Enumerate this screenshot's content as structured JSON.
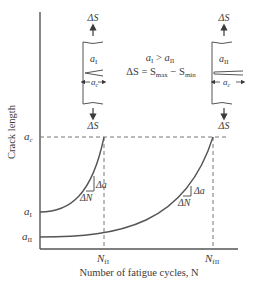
{
  "diagram": {
    "type": "fatigue crack growth curves",
    "y_axis_label": "Crack length",
    "x_axis_label": "Number of fatigue cycles, N",
    "y_ticks": {
      "critical": {
        "base": "a",
        "sub": "c"
      },
      "initial_I": {
        "base": "a",
        "sub": "I"
      },
      "initial_II": {
        "base": "a",
        "sub": "II"
      }
    },
    "x_ticks": {
      "fail_I": {
        "base": "N",
        "sub": "fI"
      },
      "fail_II": {
        "base": "N",
        "sub": "fII"
      }
    },
    "relation_line1": {
      "a1": "a",
      "a1_sub": "I",
      "op": " > ",
      "a2": "a",
      "a2_sub": "II"
    },
    "relation_line2": {
      "lhs": "ΔS = S",
      "max_sub": "max",
      "mid": " − S",
      "min_sub": "min"
    },
    "slope_labels": {
      "da": "Δa",
      "dN": "ΔN"
    },
    "specimen_I": {
      "stress_top": "ΔS",
      "stress_bottom": "ΔS",
      "label": "a",
      "label_sub": "I",
      "crack_dim": "a",
      "crack_dim_sub": "c"
    },
    "specimen_II": {
      "stress_top": "ΔS",
      "stress_bottom": "ΔS",
      "label": "a",
      "label_sub": "II",
      "crack_dim": "a",
      "crack_dim_sub": "c"
    },
    "colors": {
      "line": "#555555",
      "text": "#3a3a3a",
      "dash": "#777777"
    }
  }
}
